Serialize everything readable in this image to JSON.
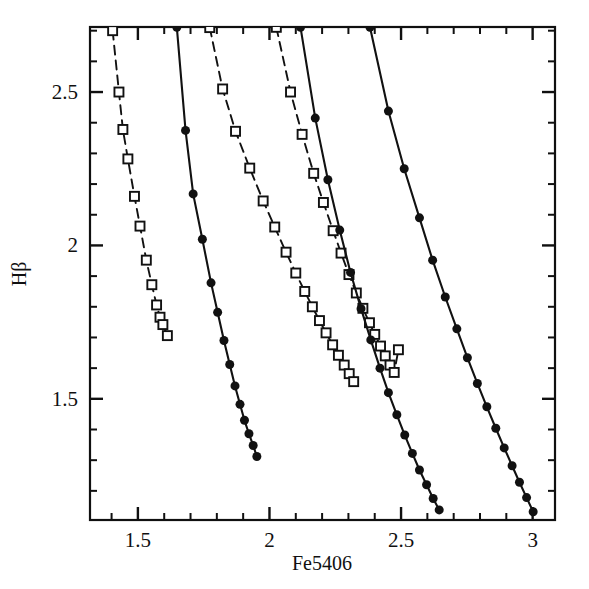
{
  "chart_data": {
    "type": "line",
    "title": "",
    "subtitle": "",
    "xlabel": "Fe5406",
    "ylabel": "Hβ",
    "xlim": [
      1.318,
      3.085
    ],
    "ylim": [
      1.105,
      2.712
    ],
    "grid": false,
    "legend": "none",
    "x_major_ticks": [
      1.5,
      2,
      2.5,
      3
    ],
    "x_major_tick_labels": [
      "1.5",
      "2",
      "2.5",
      "3"
    ],
    "x_minor_tick_step": 0.1,
    "y_major_ticks": [
      1.5,
      2,
      2.5
    ],
    "y_major_tick_labels": [
      "1.5",
      "2",
      "2.5"
    ],
    "y_minor_tick_step": 0.1,
    "marker_open_square_size": 9,
    "marker_filled_circle_size": 9,
    "line_color": "#111111",
    "series": [
      {
        "name": "dashed-track-1",
        "style": "dashed",
        "marker": "open-square",
        "x": [
          1.404,
          1.428,
          1.443,
          1.462,
          1.487,
          1.508,
          1.532,
          1.553,
          1.571,
          1.584,
          1.595,
          1.612
        ],
        "y": [
          2.7,
          2.5,
          2.378,
          2.282,
          2.16,
          2.063,
          1.952,
          1.872,
          1.806,
          1.766,
          1.742,
          1.706
        ]
      },
      {
        "name": "solid-track-1",
        "style": "solid",
        "marker": "filled-circle",
        "x": [
          1.648,
          1.681,
          1.71,
          1.745,
          1.778,
          1.803,
          1.827,
          1.849,
          1.869,
          1.888,
          1.905,
          1.922,
          1.938,
          1.952
        ],
        "y": [
          2.711,
          2.375,
          2.168,
          2.02,
          1.878,
          1.782,
          1.69,
          1.612,
          1.542,
          1.482,
          1.43,
          1.386,
          1.348,
          1.312
        ]
      },
      {
        "name": "dashed-track-2",
        "style": "dashed",
        "marker": "open-square",
        "x": [
          1.773,
          1.822,
          1.871,
          1.925,
          1.976,
          2.02,
          2.063,
          2.1,
          2.134,
          2.163,
          2.19,
          2.215,
          2.24,
          2.262,
          2.284,
          2.303,
          2.32
        ],
        "y": [
          2.71,
          2.51,
          2.372,
          2.252,
          2.145,
          2.06,
          1.978,
          1.91,
          1.85,
          1.8,
          1.755,
          1.715,
          1.676,
          1.642,
          1.61,
          1.582,
          1.556
        ]
      },
      {
        "name": "dashed-track-3",
        "style": "dashed",
        "marker": "open-square",
        "x": [
          2.026,
          2.08,
          2.124,
          2.168,
          2.205,
          2.242,
          2.272,
          2.302,
          2.33,
          2.355,
          2.38,
          2.4,
          2.422,
          2.44,
          2.458,
          2.474,
          2.49
        ],
        "y": [
          2.711,
          2.5,
          2.362,
          2.235,
          2.14,
          2.048,
          1.975,
          1.905,
          1.845,
          1.795,
          1.748,
          1.71,
          1.672,
          1.64,
          1.61,
          1.586,
          1.66
        ]
      },
      {
        "name": "solid-track-2",
        "style": "solid",
        "marker": "filled-circle",
        "x": [
          2.118,
          2.174,
          2.222,
          2.267,
          2.308,
          2.348,
          2.385,
          2.42,
          2.452,
          2.484,
          2.514,
          2.543,
          2.57,
          2.597,
          2.622,
          2.645
        ],
        "y": [
          2.711,
          2.415,
          2.214,
          2.05,
          1.912,
          1.794,
          1.692,
          1.6,
          1.52,
          1.448,
          1.382,
          1.322,
          1.268,
          1.22,
          1.175,
          1.138
        ]
      },
      {
        "name": "solid-track-3",
        "style": "solid",
        "marker": "filled-circle",
        "x": [
          2.382,
          2.452,
          2.512,
          2.57,
          2.62,
          2.668,
          2.712,
          2.752,
          2.79,
          2.826,
          2.86,
          2.892,
          2.922,
          2.95,
          2.977,
          3.002
        ],
        "y": [
          2.711,
          2.438,
          2.25,
          2.09,
          1.952,
          1.832,
          1.728,
          1.634,
          1.55,
          1.474,
          1.404,
          1.34,
          1.282,
          1.228,
          1.178,
          1.132
        ]
      }
    ]
  },
  "axes": {
    "plot_left_px": 90,
    "plot_right_px": 555,
    "plot_top_px": 27,
    "plot_bottom_px": 520
  }
}
